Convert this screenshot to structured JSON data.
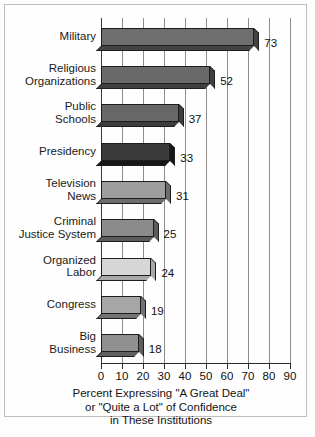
{
  "chart_data": {
    "type": "bar",
    "orientation": "horizontal",
    "title": "",
    "subtitle": "",
    "xlabel": "Percent Expressing \"A Great Deal\" or \"Quite a Lot\" of Confidence in These Institutions",
    "ylabel": "",
    "xlim": [
      0,
      90
    ],
    "xticks": [
      0,
      10,
      20,
      30,
      40,
      50,
      60,
      70,
      80,
      90
    ],
    "xtick_labels": [
      "0",
      "10",
      "20",
      "30",
      "40",
      "50",
      "60",
      "70",
      "80",
      "90"
    ],
    "grid": true,
    "grid_axis": "x",
    "legend": false,
    "categories": [
      "Military",
      "Religious Organizations",
      "Public Schools",
      "Presidency",
      "Television News",
      "Criminal Justice System",
      "Organized Labor",
      "Congress",
      "Big Business"
    ],
    "values": [
      73,
      52,
      37,
      33,
      31,
      25,
      24,
      19,
      18
    ],
    "data_labels": [
      "73",
      "52",
      "37",
      "33",
      "31",
      "25",
      "24",
      "19",
      "18"
    ],
    "bar_colors": [
      "#6e6e6e",
      "#6a6a6a",
      "#676767",
      "#3a3a3a",
      "#9e9e9e",
      "#8b8b8b",
      "#d6d6d6",
      "#a6a6a6",
      "#909090"
    ],
    "bar_shade_colors": [
      "#434343",
      "#3f3f3f",
      "#3d3d3d",
      "#161616",
      "#6d6d6d",
      "#5c5c5c",
      "#a8a8a8",
      "#737373",
      "#5f5f5f"
    ]
  },
  "axis_caption": {
    "line1": "Percent Expressing \"A Great Deal\"",
    "line2": "or \"Quite a Lot\" of Confidence",
    "line3": "in These Institutions"
  },
  "category_labels": [
    "Military",
    "Religious\nOrganizations",
    "Public\nSchools",
    "Presidency",
    "Television\nNews",
    "Criminal\nJustice System",
    "Organized\nLabor",
    "Congress",
    "Big\nBusiness"
  ]
}
